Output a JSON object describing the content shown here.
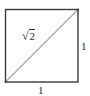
{
  "figure": {
    "type": "unit-square-with-diagonal",
    "colors": {
      "stroke": "#3a3a3a",
      "diagonal": "#6a6a6a",
      "text": "#2a2a2a",
      "background": "#ffffff"
    },
    "square": {
      "x": 5,
      "y": 9,
      "size": 73
    },
    "labels": {
      "diagonal": {
        "radical": "√",
        "radicand": "2"
      },
      "right_side": "1",
      "bottom_side": "1"
    }
  }
}
